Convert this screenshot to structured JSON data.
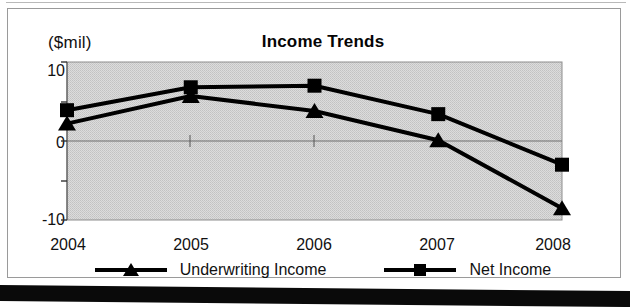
{
  "chart_data": {
    "type": "line",
    "title": "Income Trends",
    "xlabel": "",
    "ylabel": "($mil)",
    "ylim": [
      -10,
      10
    ],
    "yticks": [
      10,
      0,
      -10
    ],
    "ytick_labels": [
      "10",
      "0",
      "-10"
    ],
    "yticks_minor": [
      5,
      -5
    ],
    "grid": false,
    "legend_position": "bottom",
    "categories": [
      "2004",
      "2005",
      "2006",
      "2007",
      "2008"
    ],
    "series": [
      {
        "name": "Underwriting Income",
        "marker": "triangle",
        "color": "#000000",
        "values": [
          2.2,
          5.7,
          3.8,
          0.1,
          -8.5
        ]
      },
      {
        "name": "Net Income",
        "marker": "square",
        "color": "#000000",
        "values": [
          3.9,
          6.8,
          7.0,
          3.4,
          -3.0
        ]
      }
    ],
    "plot_background": "#d4d4d4"
  },
  "legend": {
    "items": [
      {
        "label": "Underwriting Income",
        "marker": "triangle-marker-icon"
      },
      {
        "label": "Net Income",
        "marker": "square-marker-icon"
      }
    ]
  }
}
